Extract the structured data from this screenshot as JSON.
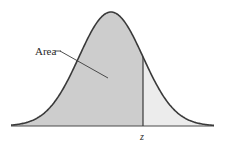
{
  "diagram": {
    "type": "normal-distribution-curve",
    "labels": {
      "area": "Area",
      "z": "z"
    },
    "colors": {
      "left_fill": "#cdcdcd",
      "right_fill": "#ececec",
      "curve": "#3a3a3a",
      "axis": "#4a4a4a",
      "background": "#ffffff"
    },
    "geometry": {
      "baseline_y": 126,
      "x_start": 11,
      "x_end": 214,
      "peak_x": 111,
      "peak_y": 12,
      "sigma_px": 32,
      "z_x": 143
    }
  }
}
